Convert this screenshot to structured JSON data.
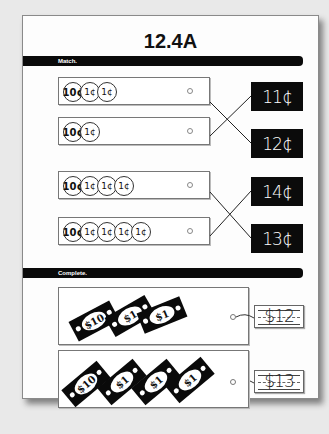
{
  "worksheet": {
    "title": "12.4A",
    "sections": {
      "match": {
        "label": "Match.",
        "rows": [
          {
            "coins": [
              "10¢",
              "1¢",
              "1¢"
            ],
            "total": "12¢"
          },
          {
            "coins": [
              "10¢",
              "1¢"
            ],
            "total": "11¢"
          },
          {
            "coins": [
              "10¢",
              "1¢",
              "1¢",
              "1¢"
            ],
            "total": "13¢"
          },
          {
            "coins": [
              "10¢",
              "1¢",
              "1¢",
              "1¢",
              "1¢"
            ],
            "total": "14¢"
          }
        ],
        "price_tags": [
          "11¢",
          "12¢",
          "14¢",
          "13¢"
        ]
      },
      "complete": {
        "label": "Complete.",
        "rows": [
          {
            "bills": [
              "$10",
              "$1",
              "$1"
            ],
            "answer": "$12"
          },
          {
            "bills": [
              "$10",
              "$1",
              "$1",
              "$1"
            ],
            "answer": "$13"
          }
        ]
      }
    },
    "colors": {
      "bar": "#0a0a0a",
      "tag": "#0b0b0b",
      "paper": "#fdfdfd",
      "background": "#e9e9e9"
    }
  }
}
